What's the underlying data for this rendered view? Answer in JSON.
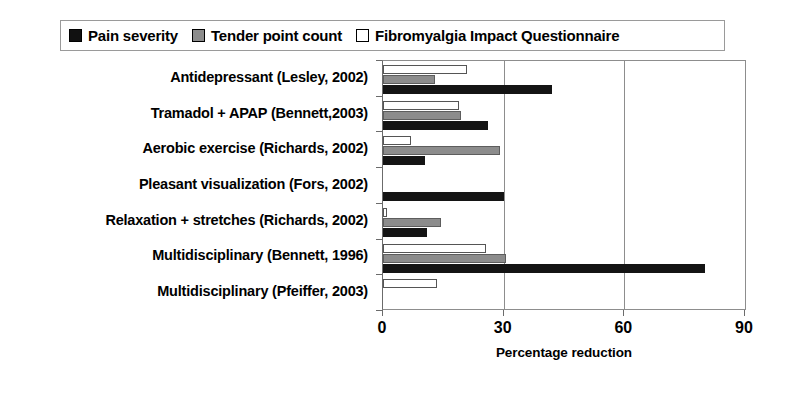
{
  "chart_data": {
    "type": "bar",
    "orientation": "horizontal",
    "title": "",
    "xlabel": "Percentage reduction",
    "ylabel": "",
    "xlim": [
      0,
      90
    ],
    "xticks": [
      0,
      30,
      60,
      90
    ],
    "grid": true,
    "legend_position": "top",
    "categories": [
      "Antidepressant (Lesley, 2002)",
      "Tramadol + APAP (Bennett,2003)",
      "Aerobic exercise (Richards, 2002)",
      "Pleasant visualization (Fors, 2002)",
      "Relaxation + stretches (Richards, 2002)",
      "Multidisciplinary (Bennett, 1996)",
      "Multidisciplinary (Pfeiffer, 2003)"
    ],
    "series": [
      {
        "name": "Pain severity",
        "color": "#141414",
        "values": [
          42,
          26,
          10.5,
          30,
          11,
          80,
          0
        ]
      },
      {
        "name": "Tender point count",
        "color": "#8c8c8c",
        "values": [
          13,
          19.5,
          29,
          0,
          14.5,
          30.5,
          0
        ]
      },
      {
        "name": "Fibromyalgia Impact Questionnaire",
        "color": "#ffffff",
        "values": [
          21,
          19,
          7,
          0,
          1,
          25.5,
          13.5
        ]
      }
    ]
  },
  "legend": {
    "items": [
      {
        "label": "Pain severity",
        "swatch": "black-square-icon"
      },
      {
        "label": "Tender point count",
        "swatch": "gray-square-icon"
      },
      {
        "label": "Fibromyalgia Impact Questionnaire",
        "swatch": "white-square-icon"
      }
    ]
  }
}
